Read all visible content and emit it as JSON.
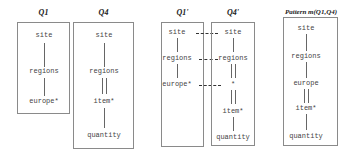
{
  "panels": [
    {
      "title": "Q1",
      "nodes": [
        "site",
        "regions",
        "europe*"
      ]
    },
    {
      "title": "Q4",
      "nodes": [
        "site",
        "regions",
        "item*",
        "quantity"
      ],
      "edges": [
        "child",
        "descendant",
        "child"
      ]
    },
    {
      "title": "Q1'",
      "nodes": [
        "site",
        "regions",
        "europe*"
      ]
    },
    {
      "title": "Q4'",
      "nodes": [
        "site",
        "regions",
        "*",
        "item*",
        "quantity"
      ],
      "edges": [
        "child",
        "descendant",
        "descendant",
        "child"
      ]
    },
    {
      "title": "Pattern m(Q1,Q4)",
      "nodes": [
        "site",
        "regions",
        "europe",
        "item*",
        "quantity"
      ],
      "edges": [
        "child",
        "child",
        "descendant",
        "child"
      ]
    }
  ],
  "mappings": [
    {
      "from": "Q1'.site",
      "to": "Q4'.site"
    },
    {
      "from": "Q1'.regions",
      "to": "Q4'.regions"
    },
    {
      "from": "Q1'.europe*",
      "to": "Q4'.*"
    }
  ]
}
